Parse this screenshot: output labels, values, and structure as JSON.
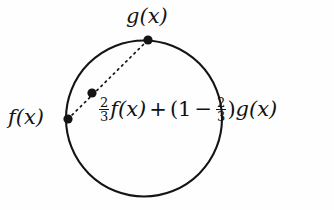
{
  "figure": {
    "background_color": "#fefefe",
    "stroke_color": "#141414"
  },
  "labels": {
    "top_point": "g(x)",
    "left_point": "f(x)"
  },
  "formula": {
    "full_text": "2/3 f(x) + (1 - 2/3) g(x)",
    "coefficient_numerator": "2",
    "coefficient_denominator": "3",
    "first_term": "f(x)",
    "plus_operator": "+",
    "open_paren": "(",
    "one": "1",
    "minus_operator": "−",
    "weight_numerator": "2",
    "weight_denominator": "3",
    "close_paren": ")",
    "second_term": "g(x)"
  },
  "geometry": {
    "circle": {
      "cx": 144,
      "cy": 118.5,
      "r": 78,
      "stroke_width": 2.1
    },
    "points": [
      {
        "name": "f-point",
        "cx": 68,
        "cy": 119,
        "r": 4.6
      },
      {
        "name": "g-point",
        "cx": 148,
        "cy": 40,
        "r": 4.6
      },
      {
        "name": "interpolated-point",
        "cx": 92,
        "cy": 93,
        "r": 4.6
      }
    ],
    "chord": {
      "x1": 68,
      "y1": 119,
      "x2": 148,
      "y2": 40,
      "dash": "1.6 4.2",
      "stroke_width": 1.7
    }
  }
}
